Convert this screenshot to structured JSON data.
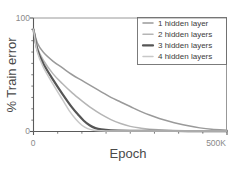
{
  "chart_data": {
    "type": "line",
    "title": "",
    "xlabel": "Epoch",
    "ylabel": "% Train error",
    "xlim": [
      0,
      500000
    ],
    "ylim": [
      0,
      100
    ],
    "grid": false,
    "legend_position": "top-right",
    "x_tick_labels": [
      "0",
      "500K"
    ],
    "y_tick_labels": [
      "0",
      "100"
    ],
    "x_unit_note": "500K",
    "series": [
      {
        "name": "1 hidden layer",
        "color": "#9a9a9a",
        "width": 1.5,
        "x": [
          0,
          10000,
          25000,
          50000,
          75000,
          100000,
          125000,
          150000,
          175000,
          200000,
          225000,
          250000,
          275000,
          300000,
          325000,
          350000,
          375000,
          400000,
          430000,
          460000,
          500000
        ],
        "y": [
          90,
          78,
          70,
          62,
          56,
          50,
          45,
          40,
          35,
          30,
          26,
          22,
          18,
          14.5,
          11.5,
          9,
          6.8,
          5,
          3.2,
          2,
          1.2
        ]
      },
      {
        "name": "2 hidden layers",
        "color": "#b5b5b5",
        "width": 1.5,
        "x": [
          0,
          10000,
          25000,
          50000,
          75000,
          100000,
          125000,
          150000,
          175000,
          200000,
          225000,
          250000,
          275000,
          300000,
          350000,
          400000,
          450000,
          500000
        ],
        "y": [
          90,
          74,
          63,
          51,
          42,
          34,
          27,
          20.5,
          15,
          10.5,
          7,
          4.5,
          3,
          2,
          1.1,
          0.7,
          0.5,
          0.4
        ]
      },
      {
        "name": "3 hidden layers",
        "color": "#555555",
        "width": 2.2,
        "x": [
          0,
          10000,
          25000,
          50000,
          75000,
          100000,
          115000,
          130000,
          145000,
          160000,
          175000,
          200000,
          250000,
          300000,
          400000,
          500000
        ],
        "y": [
          90,
          72,
          60,
          46,
          33,
          21,
          15,
          9.5,
          5.5,
          3,
          1.8,
          1.0,
          0.6,
          0.5,
          0.4,
          0.4
        ]
      },
      {
        "name": "4 hidden layers",
        "color": "#c8c8c8",
        "width": 1.5,
        "x": [
          0,
          10000,
          25000,
          50000,
          75000,
          95000,
          110000,
          125000,
          140000,
          155000,
          175000,
          200000,
          250000,
          300000,
          400000,
          500000
        ],
        "y": [
          90,
          70,
          57,
          42,
          28,
          17,
          10.5,
          5.5,
          2.5,
          1.2,
          0.7,
          0.5,
          0.4,
          0.4,
          0.4,
          0.4
        ]
      }
    ]
  },
  "legend": {
    "items": [
      {
        "label": "1 hidden layer"
      },
      {
        "label": "2 hidden layers"
      },
      {
        "label": "3 hidden layers"
      },
      {
        "label": "4 hidden layers"
      }
    ]
  },
  "axes": {
    "y_top_label": "100",
    "y_bottom_label": "0",
    "x_left_label": "0",
    "x_right_label": "500K",
    "x_title": "Epoch",
    "y_title": "% Train error"
  },
  "colors": {
    "axis": "#5a5a5a",
    "tick_text": "#8a8a8a",
    "title_text": "#4a4a4a",
    "legend_border": "#6e6e6e",
    "background": "#ffffff"
  }
}
